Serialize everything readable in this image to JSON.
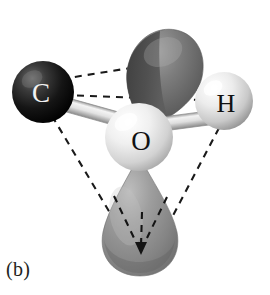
{
  "figure": {
    "panel_label": "(b)",
    "caption_visible": false,
    "background_color": "#ffffff"
  },
  "molecule": {
    "central_atom": {
      "symbol": "O",
      "name": "oxygen",
      "label_color": "#111111",
      "sphere_color": "#e8e8e8",
      "highlight_color": "#ffffff",
      "shadow_color": "#9b9b9b",
      "cx": 139,
      "cy": 137,
      "r": 34
    },
    "bonded_atoms": [
      {
        "symbol": "C",
        "name": "carbon",
        "label_color": "#f2f2f2",
        "sphere_color": "#1c1c1c",
        "highlight_color": "#6a6a6a",
        "shadow_color": "#000000",
        "cx": 43,
        "cy": 92,
        "r": 31
      },
      {
        "symbol": "H",
        "name": "hydrogen",
        "label_color": "#111111",
        "sphere_color": "#dcdcdc",
        "highlight_color": "#ffffff",
        "shadow_color": "#8e8e8e",
        "cx": 224,
        "cy": 101,
        "r": 29
      }
    ],
    "bonds": [
      {
        "name": "carbon-oxygen-bond",
        "from": "C",
        "to": "O",
        "style": "cylinder",
        "color": "#d5d5d5",
        "edge_color": "#8f8f8f"
      },
      {
        "name": "oxygen-hydrogen-bond",
        "from": "O",
        "to": "H",
        "style": "cylinder",
        "color": "#d5d5d5",
        "edge_color": "#8f8f8f"
      }
    ],
    "lone_pairs": [
      {
        "name": "upper-lone-pair-lobe",
        "orientation": "up",
        "fill_color": "#6e6e6e",
        "shade_color": "#3f3f3f",
        "highlight_color": "#9a9a9a"
      },
      {
        "name": "lower-lone-pair-lobe",
        "orientation": "down",
        "fill_color": "#8a8a8a",
        "shade_color": "#5c5c5c",
        "highlight_color": "#b4b4b4"
      }
    ],
    "tetrahedron": {
      "name": "tetrahedral-geometry-guides",
      "line_style": "dashed",
      "line_color": "#1a1a1a",
      "dash_pattern": "7 6",
      "vertices": [
        "C",
        "H",
        "upper-lone-pair",
        "lower-lone-pair"
      ],
      "edge_count": 6,
      "arrow_present": true,
      "arrow_direction": "down"
    }
  }
}
